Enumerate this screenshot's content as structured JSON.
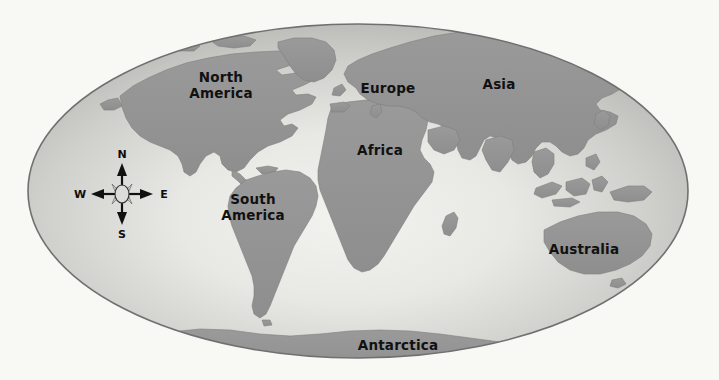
{
  "document": {
    "type": "world-map",
    "title": "World Map",
    "projection": "elliptical (Mollweide-style)",
    "background_color": "#f8f8f5"
  },
  "map": {
    "ocean_color_center": "#ededea",
    "ocean_color_edge": "#b2b2b2",
    "land_color": "#949494",
    "outline_color": "#6f6f6f",
    "label_color": "#111111",
    "ellipse": {
      "center_x": 358,
      "center_y": 191,
      "radius_x": 330,
      "radius_y": 167
    },
    "labels": [
      {
        "id": "north-america",
        "text_line1": "North",
        "text_line2": "America",
        "x": 221,
        "y": 82
      },
      {
        "id": "europe",
        "text_line1": "Europe",
        "text_line2": "",
        "x": 388,
        "y": 93
      },
      {
        "id": "asia",
        "text_line1": "Asia",
        "text_line2": "",
        "x": 499,
        "y": 89
      },
      {
        "id": "africa",
        "text_line1": "Africa",
        "text_line2": "",
        "x": 380,
        "y": 155
      },
      {
        "id": "south-america",
        "text_line1": "South",
        "text_line2": "America",
        "x": 253,
        "y": 204
      },
      {
        "id": "australia",
        "text_line1": "Australia",
        "text_line2": "",
        "x": 584,
        "y": 254
      },
      {
        "id": "antarctica",
        "text_line1": "Antarctica",
        "text_line2": "",
        "x": 398,
        "y": 350
      }
    ]
  },
  "compass": {
    "id": "compass-rose",
    "center_x": 122,
    "center_y": 194,
    "arm_length": 32,
    "north_label": "N",
    "east_label": "E",
    "south_label": "S",
    "west_label": "W",
    "center_fill": "#d8d8d4",
    "stroke_color": "#111111"
  }
}
